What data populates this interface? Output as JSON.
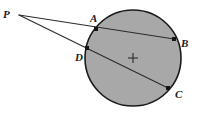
{
  "figure": {
    "width": 198,
    "height": 115,
    "background_color": "#ffffff"
  },
  "circle": {
    "center_label": "+",
    "center_x": 133,
    "center_y": 58,
    "radius": 48,
    "fill_color": "#a8a8a8",
    "stroke_color": "#1a1a1a",
    "stroke_width": 1.6
  },
  "external_point": {
    "label": "P",
    "x": 19,
    "y": 15,
    "label_x": 3,
    "label_y": 9
  },
  "points": [
    {
      "label": "A",
      "x": 96,
      "y": 29,
      "label_x": 90,
      "label_y": 13
    },
    {
      "label": "B",
      "x": 174,
      "y": 39,
      "label_x": 181,
      "label_y": 38
    },
    {
      "label": "D",
      "x": 87,
      "y": 48,
      "label_x": 75,
      "label_y": 52
    },
    {
      "label": "C",
      "x": 168,
      "y": 88,
      "label_x": 175,
      "label_y": 89
    }
  ],
  "secants": [
    {
      "name": "secant-P-A-B",
      "from": "P",
      "through": "A",
      "to": "B",
      "x1": 19,
      "y1": 15,
      "x2": 174,
      "y2": 39
    },
    {
      "name": "secant-P-D-C",
      "from": "P",
      "through": "D",
      "to": "C",
      "x1": 19,
      "y1": 15,
      "x2": 168,
      "y2": 88
    }
  ],
  "style": {
    "line_color": "#2b2b2b",
    "line_width": 1.1,
    "marker_color": "#151515",
    "marker_size": 4,
    "label_color": "#1a1a1a"
  }
}
